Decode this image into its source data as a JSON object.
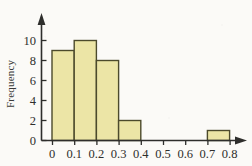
{
  "chart_data": {
    "type": "bar",
    "title": "",
    "subtitle": "",
    "xlabel": "",
    "ylabel": "Frequency",
    "categories": [
      "0-0.1",
      "0.1-0.2",
      "0.2-0.3",
      "0.3-0.4",
      "0.4-0.5",
      "0.5-0.6",
      "0.6-0.7",
      "0.7-0.8"
    ],
    "bin_edges": [
      0,
      0.1,
      0.2,
      0.3,
      0.4,
      0.5,
      0.6,
      0.7,
      0.8
    ],
    "values": [
      9,
      10,
      8,
      2,
      0,
      0,
      0,
      1
    ],
    "xlim": [
      0,
      0.8
    ],
    "ylim": [
      0,
      11
    ],
    "xticks": [
      0,
      0.1,
      0.2,
      0.3,
      0.4,
      0.5,
      0.6,
      0.7,
      0.8
    ],
    "xtick_labels": [
      "0",
      "0.1",
      "0.2",
      "0.3",
      "0.4",
      "0.5",
      "0.6",
      "0.7",
      "0.8"
    ],
    "yticks": [
      0,
      2,
      4,
      6,
      8,
      10
    ],
    "ytick_labels": [
      "0",
      "2",
      "4",
      "6",
      "8",
      "10"
    ],
    "grid": false,
    "legend": null,
    "annotations": [],
    "bar_fill_color": "#ece5a6",
    "bar_edge_color": "#4c4a2c",
    "axis_color": "#2e2e2c",
    "background_color": "#fbfaf7",
    "axis_arrows": {
      "x": "right",
      "y": "up"
    }
  },
  "axis_labels": {
    "y_axis_title": "Frequency"
  },
  "ytick_labels": {
    "t0": "0",
    "t1": "2",
    "t2": "4",
    "t3": "6",
    "t4": "8",
    "t5": "10"
  },
  "xtick_labels": {
    "t0": "0",
    "t1": "0.1",
    "t2": "0.2",
    "t3": "0.3",
    "t4": "0.4",
    "t5": "0.5",
    "t6": "0.6",
    "t7": "0.7",
    "t8": "0.8"
  }
}
